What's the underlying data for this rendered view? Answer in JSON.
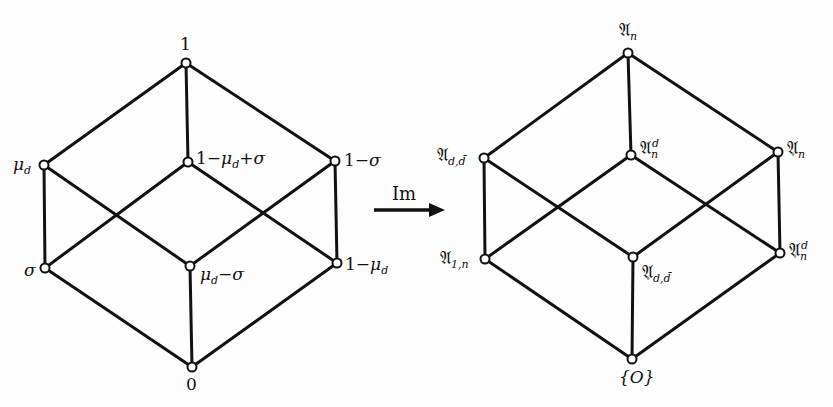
{
  "diagram": {
    "left_lattice": {
      "name": "lattice-of-measures",
      "nodes": [
        {
          "id": "top",
          "label": "1",
          "x": 186,
          "y": 63
        },
        {
          "id": "mu_d",
          "label": "μd",
          "x": 44,
          "y": 165
        },
        {
          "id": "one_minus_mu_plus_sigma",
          "label": "1−μd+σ",
          "x": 188,
          "y": 162
        },
        {
          "id": "one_minus_sigma",
          "label": "1−σ",
          "x": 335,
          "y": 161
        },
        {
          "id": "sigma",
          "label": "σ",
          "x": 45,
          "y": 268
        },
        {
          "id": "mu_minus_sigma",
          "label": "μd−σ",
          "x": 190,
          "y": 266
        },
        {
          "id": "one_minus_mu",
          "label": "1−μd",
          "x": 337,
          "y": 263
        },
        {
          "id": "bottom",
          "label": "0",
          "x": 192,
          "y": 367
        }
      ]
    },
    "arrow": {
      "label": "Im"
    },
    "right_lattice": {
      "name": "lattice-of-images",
      "nodes": [
        {
          "id": "top",
          "label": "𝔄n",
          "x": 628,
          "y": 53
        },
        {
          "id": "A_dd",
          "label": "𝔄d,d̄",
          "x": 484,
          "y": 158
        },
        {
          "id": "A_n_d",
          "label": "𝔄n^d",
          "x": 631,
          "y": 155
        },
        {
          "id": "A_circ_n",
          "label": "𝔄̊n",
          "x": 778,
          "y": 152
        },
        {
          "id": "A_1n",
          "label": "𝔄1,n",
          "x": 485,
          "y": 259
        },
        {
          "id": "A_circ_dd",
          "label": "𝔄̊d,d̄",
          "x": 633,
          "y": 257
        },
        {
          "id": "A_circ_n_d",
          "label": "𝔄̊n^d",
          "x": 780,
          "y": 253
        },
        {
          "id": "bottom",
          "label": "{O}",
          "x": 632,
          "y": 359
        }
      ]
    },
    "labels": {
      "one": "1",
      "mu": "μ",
      "d": "d",
      "sigma": "σ",
      "one_minus": "1−",
      "plus_sigma": "+σ",
      "minus_sigma": "−σ",
      "zero": "0",
      "im": "Im",
      "frak_A": "𝔄",
      "n": "n",
      "dd": "d,d̄",
      "one_n": "1,n",
      "ring": "∘",
      "O_set": "{O}"
    }
  }
}
